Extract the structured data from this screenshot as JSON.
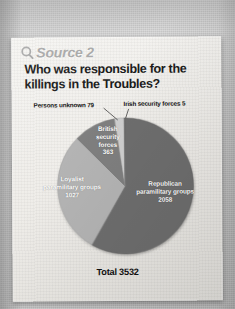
{
  "source": {
    "icon": "magnifier-icon",
    "label": "Source 2"
  },
  "title": "Who was responsible for the killings in the Troubles?",
  "total_label": "Total 3532",
  "labels": {
    "persons_unknown": "Persons unknown 79",
    "irish_security_forces": "Irish security forces 5",
    "british_security_forces": "British\nsecurity\nforces\n363",
    "loyalist": "Loyalist\nparamilitary groups\n1027",
    "republican": "Republican\nparamilitary groups\n2058"
  },
  "colors": {
    "republican": "#6e6e6e",
    "loyalist": "#b4b4b4",
    "british": "#7f7f7f",
    "persons_unknown": "#cfcfcf",
    "irish": "#8a8a8a",
    "card": "#efedea",
    "backdrop": "#c9c9c9",
    "title_text": "#1b1b1b",
    "source_text": "#a8a8a8",
    "slice_text": "#ffffff"
  },
  "chart_data": {
    "type": "pie",
    "title": "Who was responsible for the killings in the Troubles?",
    "subtitle": "Source 2",
    "total": 3532,
    "total_label": "Total 3532",
    "legend": "none",
    "labels_position": "inside-and-callout",
    "categories": [
      "Republican paramilitary groups",
      "Loyalist paramilitary groups",
      "British security forces",
      "Persons unknown",
      "Irish security forces"
    ],
    "values": [
      2058,
      1027,
      363,
      79,
      5
    ],
    "percentages": [
      58.3,
      29.1,
      10.3,
      2.2,
      0.1
    ],
    "slices": [
      {
        "name": "Republican paramilitary groups",
        "value": 2058,
        "percent": 58.3,
        "color": "#6e6e6e",
        "label_inside": true
      },
      {
        "name": "Loyalist paramilitary groups",
        "value": 1027,
        "percent": 29.1,
        "color": "#b4b4b4",
        "label_inside": true
      },
      {
        "name": "British security forces",
        "value": 363,
        "percent": 10.3,
        "color": "#7f7f7f",
        "label_inside": true
      },
      {
        "name": "Persons unknown",
        "value": 79,
        "percent": 2.2,
        "color": "#cfcfcf",
        "label_inside": false
      },
      {
        "name": "Irish security forces",
        "value": 5,
        "percent": 0.1,
        "color": "#8a8a8a",
        "label_inside": false
      }
    ]
  }
}
